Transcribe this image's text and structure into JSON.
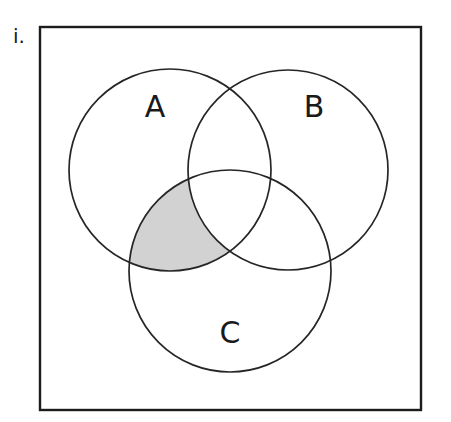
{
  "figure": {
    "item_label": "i.",
    "caption": "",
    "background_color": "#ffffff",
    "frame": {
      "name": "universal-set-box",
      "x": 40,
      "y": 27,
      "width": 381,
      "height": 383,
      "stroke_color": "#1c1c1c",
      "fill_color": "#ffffff"
    }
  },
  "diagram": {
    "type": "venn-3-set",
    "stroke_color": "#262626",
    "shade_color": "#d2d2d2",
    "shaded_region_description": "A and C but not B",
    "sets": [
      {
        "id": "A",
        "label": "A",
        "cx": 170,
        "cy": 170,
        "r": 101,
        "label_x": 155,
        "label_y": 117
      },
      {
        "id": "B",
        "label": "B",
        "cx": 288,
        "cy": 170,
        "r": 100,
        "label_x": 314,
        "label_y": 117
      },
      {
        "id": "C",
        "label": "C",
        "cx": 230,
        "cy": 271,
        "r": 101,
        "label_x": 230,
        "label_y": 343
      }
    ]
  }
}
